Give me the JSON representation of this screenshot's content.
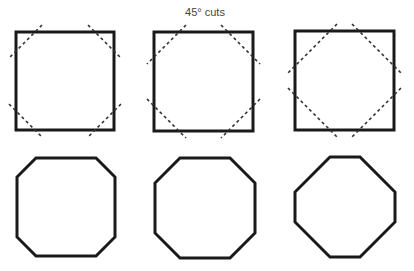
{
  "caption": "45° cuts",
  "colors": {
    "stroke": "#1a1a1a",
    "dash": "#333333",
    "caption": "#444444",
    "background": "#ffffff"
  },
  "squares": [
    {
      "x": 16,
      "y": 32,
      "size": 98,
      "cut": 19
    },
    {
      "x": 154,
      "y": 32,
      "size": 99,
      "cut": 25
    },
    {
      "x": 295,
      "y": 31,
      "size": 99,
      "cut": 35
    }
  ],
  "octagons": [
    {
      "x": 17,
      "y": 158,
      "size": 98,
      "cut": 19
    },
    {
      "x": 155,
      "y": 158,
      "size": 100,
      "cut": 25
    },
    {
      "x": 295,
      "y": 157,
      "size": 100,
      "cut": 35
    }
  ]
}
